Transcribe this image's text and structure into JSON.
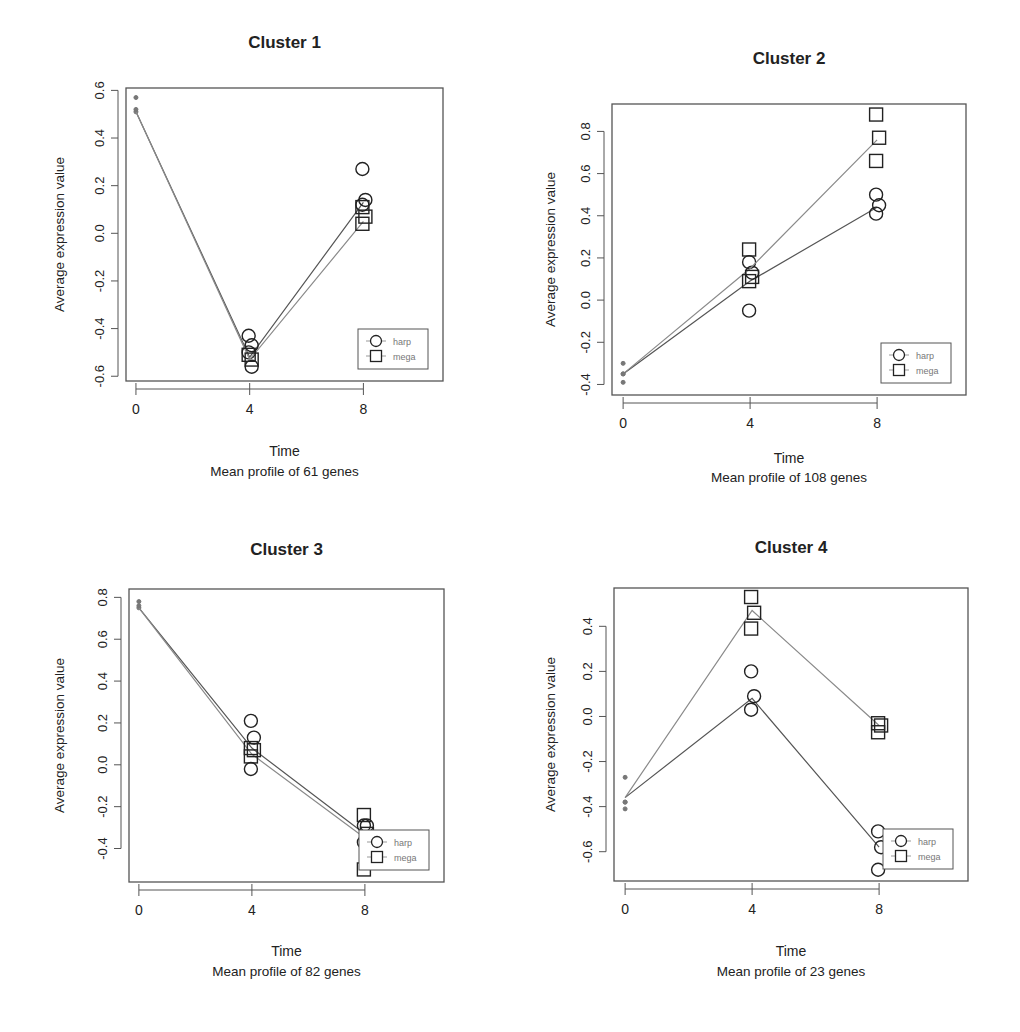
{
  "figure": {
    "legend_labels": [
      "harp",
      "mega"
    ],
    "x_axis_label": "Time",
    "y_axis_label": "Average expression value"
  },
  "chart_data": [
    {
      "type": "line",
      "title": "Cluster 1",
      "subtitle": "Mean profile of  61  genes",
      "xlabel": "Time",
      "ylabel": "Average expression value",
      "x": [
        0,
        4,
        8
      ],
      "xticks": [
        0,
        4,
        8
      ],
      "xlim": [
        -0.35,
        10.8
      ],
      "yticks": [
        -0.6,
        -0.4,
        -0.2,
        0.0,
        0.2,
        0.4,
        0.6
      ],
      "ytick_labels": [
        "-0.6",
        "-0.4",
        "-0.2",
        "0.0",
        "0.2",
        "0.4",
        "0.6"
      ],
      "ylim": [
        -0.62,
        0.61
      ],
      "legend": {
        "position": "bottom-right",
        "entries": [
          "harp",
          "mega"
        ]
      },
      "grid": false,
      "series": [
        {
          "name": "harp",
          "marker": "circle",
          "mean": [
            0.51,
            -0.52,
            0.13
          ],
          "replicates": {
            "0": [
              0.57,
              0.51
            ],
            "4": [
              -0.43,
              -0.47,
              -0.5,
              -0.56
            ],
            "8": [
              0.27,
              0.14,
              0.12
            ]
          }
        },
        {
          "name": "mega",
          "marker": "square",
          "mean": [
            0.51,
            -0.53,
            0.05
          ],
          "replicates": {
            "0": [
              0.52
            ],
            "4": [
              -0.51,
              -0.53
            ],
            "8": [
              0.11,
              0.07,
              0.04
            ]
          }
        }
      ]
    },
    {
      "type": "line",
      "title": "Cluster 2",
      "subtitle": "Mean profile of  108  genes",
      "xlabel": "Time",
      "ylabel": "Average expression value",
      "x": [
        0,
        4,
        8
      ],
      "xticks": [
        0,
        4,
        8
      ],
      "xlim": [
        -0.35,
        10.8
      ],
      "yticks": [
        -0.4,
        -0.2,
        0.0,
        0.2,
        0.4,
        0.6,
        0.8
      ],
      "ytick_labels": [
        "-0.4",
        "-0.2",
        "0.0",
        "0.2",
        "0.4",
        "0.6",
        "0.8"
      ],
      "ylim": [
        -0.45,
        0.93
      ],
      "legend": {
        "position": "bottom-right",
        "entries": [
          "harp",
          "mega"
        ]
      },
      "grid": false,
      "series": [
        {
          "name": "harp",
          "marker": "circle",
          "mean": [
            -0.35,
            0.09,
            0.44
          ],
          "replicates": {
            "0": [
              -0.3,
              -0.35,
              -0.39
            ],
            "4": [
              0.18,
              0.13,
              -0.05
            ],
            "8": [
              0.5,
              0.45,
              0.41
            ]
          }
        },
        {
          "name": "mega",
          "marker": "square",
          "mean": [
            -0.35,
            0.15,
            0.76
          ],
          "replicates": {
            "0": [
              -0.35
            ],
            "4": [
              0.24,
              0.11,
              0.09
            ],
            "8": [
              0.88,
              0.77,
              0.66
            ]
          }
        }
      ]
    },
    {
      "type": "line",
      "title": "Cluster 3",
      "subtitle": "Mean profile of  82  genes",
      "xlabel": "Time",
      "ylabel": "Average expression value",
      "x": [
        0,
        4,
        8
      ],
      "xticks": [
        0,
        4,
        8
      ],
      "xlim": [
        -0.35,
        10.8
      ],
      "yticks": [
        -0.4,
        -0.2,
        0.0,
        0.2,
        0.4,
        0.6,
        0.8
      ],
      "ytick_labels": [
        "-0.4",
        "-0.2",
        "0.0",
        "0.2",
        "0.4",
        "0.6",
        "0.8"
      ],
      "ylim": [
        -0.56,
        0.84
      ],
      "legend": {
        "position": "bottom-right",
        "entries": [
          "harp",
          "mega"
        ]
      },
      "grid": false,
      "series": [
        {
          "name": "harp",
          "marker": "circle",
          "mean": [
            0.75,
            0.08,
            -0.33
          ],
          "replicates": {
            "0": [
              0.78,
              0.75
            ],
            "4": [
              0.21,
              0.13,
              -0.02
            ],
            "8": [
              -0.29,
              -0.29,
              -0.37
            ]
          }
        },
        {
          "name": "mega",
          "marker": "square",
          "mean": [
            0.75,
            0.05,
            -0.35
          ],
          "replicates": {
            "0": [
              0.76
            ],
            "4": [
              0.08,
              0.07,
              0.04
            ],
            "8": [
              -0.24,
              -0.33,
              -0.5
            ]
          }
        }
      ]
    },
    {
      "type": "line",
      "title": "Cluster 4",
      "subtitle": "Mean profile of  23  genes",
      "xlabel": "Time",
      "ylabel": "Average expression value",
      "x": [
        0,
        4,
        8
      ],
      "xticks": [
        0,
        4,
        8
      ],
      "xlim": [
        -0.35,
        10.8
      ],
      "yticks": [
        -0.6,
        -0.4,
        -0.2,
        0.0,
        0.2,
        0.4
      ],
      "ytick_labels": [
        "-0.6",
        "-0.4",
        "-0.2",
        "0.0",
        "0.2",
        "0.4"
      ],
      "ylim": [
        -0.73,
        0.57
      ],
      "legend": {
        "position": "bottom-right",
        "entries": [
          "harp",
          "mega"
        ]
      },
      "grid": false,
      "series": [
        {
          "name": "harp",
          "marker": "circle",
          "mean": [
            -0.36,
            0.08,
            -0.58
          ],
          "replicates": {
            "0": [
              -0.27,
              -0.38,
              -0.41
            ],
            "4": [
              0.2,
              0.09,
              0.03
            ],
            "8": [
              -0.51,
              -0.58,
              -0.68
            ]
          }
        },
        {
          "name": "mega",
          "marker": "square",
          "mean": [
            -0.36,
            0.47,
            -0.04
          ],
          "replicates": {
            "0": [
              -0.38
            ],
            "4": [
              0.53,
              0.46,
              0.39
            ],
            "8": [
              -0.03,
              -0.04,
              -0.07
            ]
          }
        }
      ]
    }
  ],
  "layout": {
    "panels": [
      {
        "box": [
          126,
          88,
          443,
          381
        ],
        "title_y": 48,
        "xlabel_y": 456,
        "sub_y": 476,
        "ylabel_x": 64
      },
      {
        "box": [
          612,
          104,
          966,
          395
        ],
        "title_y": 64,
        "xlabel_y": 463,
        "sub_y": 482,
        "ylabel_x": 555
      },
      {
        "box": [
          129,
          589,
          444,
          882
        ],
        "title_y": 555,
        "xlabel_y": 956,
        "sub_y": 976,
        "ylabel_x": 64
      },
      {
        "box": [
          614,
          588,
          968,
          881
        ],
        "title_y": 553,
        "xlabel_y": 956,
        "sub_y": 976,
        "ylabel_x": 555
      }
    ],
    "colors": {
      "axis": "#555555",
      "line_harp": "#555555",
      "line_mega": "#8a8a8a",
      "marker": "#222222",
      "text": "#222222"
    }
  }
}
